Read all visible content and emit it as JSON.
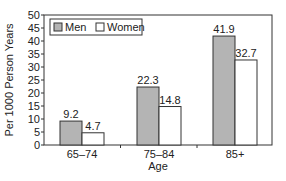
{
  "chart_data": {
    "type": "bar",
    "title": "",
    "xlabel": "Age",
    "ylabel": "Per 1000 Person Years",
    "categories": [
      "65–74",
      "75–84",
      "85+"
    ],
    "series": [
      {
        "name": "Men",
        "values": [
          9.2,
          22.3,
          41.9
        ],
        "color": "#b4b4b4"
      },
      {
        "name": "Women",
        "values": [
          4.7,
          14.8,
          32.7
        ],
        "color": "#ffffff"
      }
    ],
    "ylim": [
      0,
      50
    ],
    "yticks": [
      0,
      5,
      10,
      15,
      20,
      25,
      30,
      35,
      40,
      45,
      50
    ],
    "grid": false,
    "legend_position": "upper-left-inside",
    "data_labels": true
  },
  "legend": {
    "men_label": "Men",
    "women_label": "Women"
  },
  "colors": {
    "men_fill": "#b4b4b4",
    "women_fill": "#ffffff",
    "axis": "#333333"
  }
}
